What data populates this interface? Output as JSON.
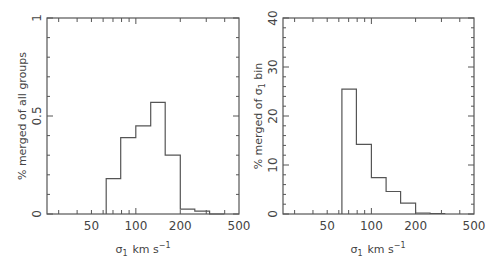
{
  "chart_data": [
    {
      "type": "bar",
      "subtype": "histogram-step",
      "title": "",
      "xlabel": "σ1 km s^-1",
      "ylabel": "% merged of all groups",
      "xscale": "log",
      "xlim": [
        25,
        500
      ],
      "ylim": [
        0,
        1
      ],
      "xticks": [
        50,
        100,
        200,
        500
      ],
      "yticks": [
        "0",
        "0.5",
        "1"
      ],
      "grid": false,
      "bin_edges": [
        63,
        79,
        100,
        126,
        158,
        200,
        251,
        316,
        398
      ],
      "values": [
        0.18,
        0.39,
        0.45,
        0.57,
        0.3,
        0.025,
        0.015,
        0.0
      ]
    },
    {
      "type": "bar",
      "subtype": "histogram-step",
      "title": "",
      "xlabel": "σ1 km s^-1",
      "ylabel": "% merged of σ1 bin",
      "xscale": "log",
      "xlim": [
        25,
        500
      ],
      "ylim": [
        0,
        40
      ],
      "xticks": [
        50,
        100,
        200,
        500
      ],
      "yticks": [
        "0",
        "10",
        "20",
        "30",
        "40"
      ],
      "grid": false,
      "bin_edges": [
        63,
        79,
        100,
        126,
        158,
        200,
        251,
        316
      ],
      "values": [
        25.5,
        14.2,
        7.4,
        4.6,
        2.2,
        0.2,
        0.1
      ]
    }
  ],
  "left": {
    "ylabel": "% merged of all groups",
    "xlabel_main": "σ",
    "xlabel_sub": "1",
    "xlabel_units": "km s",
    "xlabel_exp": "−1",
    "yticks": [
      "0",
      "0.5",
      "1"
    ],
    "xticks": [
      "50",
      "100",
      "200",
      "500"
    ]
  },
  "right": {
    "ylabel_pre": "% merged of σ",
    "ylabel_sub": "1",
    "ylabel_post": " bin",
    "xlabel_main": "σ",
    "xlabel_sub": "1",
    "xlabel_units": "km s",
    "xlabel_exp": "−1",
    "yticks": [
      "0",
      "10",
      "20",
      "30",
      "40"
    ],
    "xticks": [
      "50",
      "100",
      "200",
      "500"
    ]
  }
}
